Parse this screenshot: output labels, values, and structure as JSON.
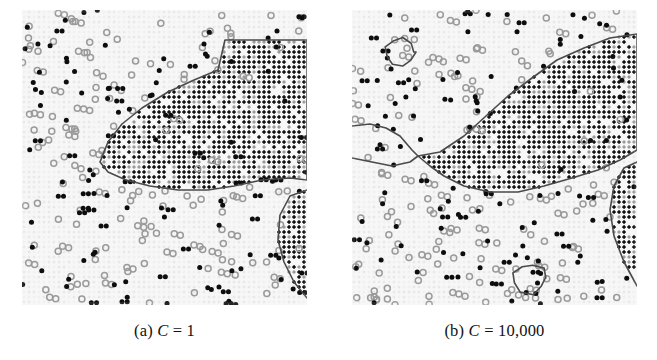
{
  "figure": {
    "type": "classification-decision-boundary-figure",
    "background_color": "#ffffff",
    "panel_count": 2
  },
  "panels": [
    {
      "id": "panel-a",
      "caption_index": "(a)",
      "caption_variable": "C",
      "caption_equals": "=",
      "caption_value": "1",
      "caption_full": "(a) C = 1",
      "x": 22,
      "y": 10,
      "width": 285,
      "height": 295,
      "seed": 1357,
      "dark_region_fill": "#111111",
      "light_region_fill": "#f0f0f0",
      "boundary_color": "#4a4a4a",
      "boundary_width": 1.6,
      "grid_color": "#e6e6e6",
      "point_dark_color": "#0d0d0d",
      "point_light_color": "#9a9a9a",
      "n_dark_points": 118,
      "n_light_points": 150,
      "islands": []
    },
    {
      "id": "panel-b",
      "caption_index": "(b)",
      "caption_variable": "C",
      "caption_equals": "=",
      "caption_value": "10,000",
      "caption_full": "(b) C = 10,000",
      "x": 352,
      "y": 10,
      "width": 285,
      "height": 295,
      "seed": 8642,
      "dark_region_fill": "#111111",
      "light_region_fill": "#f0f0f0",
      "boundary_color": "#4a4a4a",
      "boundary_width": 1.6,
      "grid_color": "#e6e6e6",
      "point_dark_color": "#0d0d0d",
      "point_light_color": "#9a9a9a",
      "n_dark_points": 122,
      "n_light_points": 152,
      "islands": [
        {
          "name": "top-left-island",
          "cx": 48,
          "cy": 42,
          "rx": 15,
          "ry": 14
        },
        {
          "name": "bottom-center-island",
          "cx": 178,
          "cy": 268,
          "rx": 18,
          "ry": 15
        }
      ]
    }
  ],
  "chart_data": {
    "type": "scatter",
    "title": "",
    "xlabel": "",
    "ylabel": "",
    "grid": true,
    "legend_position": "none",
    "series": [
      {
        "name": "class-dark-region",
        "marker": "filled-dot",
        "color": "#0d0d0d"
      },
      {
        "name": "class-light-region",
        "marker": "open-circle",
        "color": "#9a9a9a"
      }
    ],
    "panels": [
      {
        "label": "(a) C = 1",
        "parameter": "C",
        "value": 1,
        "boundary_smoothness": "smooth",
        "island_count": 0,
        "boundary_polygon_main": [
          [
            78,
            152
          ],
          [
            86,
            132
          ],
          [
            100,
            114
          ],
          [
            120,
            98
          ],
          [
            146,
            82
          ],
          [
            172,
            70
          ],
          [
            196,
            60
          ],
          [
            203,
            30
          ],
          [
            285,
            30
          ],
          [
            285,
            40
          ],
          [
            285,
            170
          ],
          [
            268,
            168
          ],
          [
            240,
            170
          ],
          [
            212,
            176
          ],
          [
            186,
            180
          ],
          [
            156,
            180
          ],
          [
            128,
            176
          ],
          [
            104,
            170
          ],
          [
            86,
            162
          ]
        ],
        "boundary_polyline_lower_right": [
          [
            285,
            180
          ],
          [
            268,
            186
          ],
          [
            258,
            205
          ],
          [
            256,
            230
          ],
          [
            262,
            252
          ],
          [
            272,
            272
          ],
          [
            285,
            288
          ]
        ]
      },
      {
        "label": "(b) C = 10,000",
        "parameter": "C",
        "value": 10000,
        "boundary_smoothness": "jagged",
        "island_count": 2,
        "boundary_polygon_main": [
          [
            66,
            146
          ],
          [
            88,
            142
          ],
          [
            112,
            126
          ],
          [
            134,
            106
          ],
          [
            156,
            86
          ],
          [
            180,
            68
          ],
          [
            205,
            50
          ],
          [
            232,
            38
          ],
          [
            258,
            28
          ],
          [
            285,
            24
          ],
          [
            285,
            44
          ],
          [
            285,
            140
          ],
          [
            268,
            150
          ],
          [
            246,
            160
          ],
          [
            220,
            168
          ],
          [
            192,
            176
          ],
          [
            166,
            182
          ],
          [
            138,
            182
          ],
          [
            112,
            176
          ],
          [
            92,
            166
          ],
          [
            78,
            156
          ]
        ],
        "boundary_polyline_lower_right": [
          [
            285,
            152
          ],
          [
            272,
            158
          ],
          [
            262,
            176
          ],
          [
            258,
            200
          ],
          [
            262,
            226
          ],
          [
            272,
            252
          ],
          [
            285,
            276
          ]
        ],
        "boundary_left_notch": [
          [
            0,
            116
          ],
          [
            18,
            114
          ],
          [
            34,
            118
          ],
          [
            48,
            126
          ],
          [
            60,
            140
          ],
          [
            66,
            146
          ],
          [
            58,
            152
          ],
          [
            40,
            156
          ],
          [
            20,
            152
          ],
          [
            0,
            148
          ]
        ]
      }
    ]
  },
  "captions": {
    "a": {
      "index": "(a)",
      "variable": "C",
      "equals": "=",
      "value": "1"
    },
    "b": {
      "index": "(b)",
      "variable": "C",
      "equals": "=",
      "value": "10,000"
    }
  }
}
